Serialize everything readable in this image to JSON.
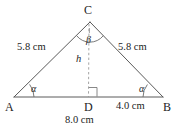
{
  "figure": {
    "shape": "triangle",
    "stroke_color": "#555555",
    "dash_color": "#8a8a8a",
    "text_color": "#1c1c1c",
    "background_color": "#ffffff",
    "vertices": [
      {
        "name": "A",
        "label": "A",
        "x": 14,
        "y": 97
      },
      {
        "name": "B",
        "label": "B",
        "x": 163,
        "y": 97
      },
      {
        "name": "C",
        "label": "C",
        "x": 90,
        "y": 22
      },
      {
        "name": "D",
        "label": "D",
        "x": 88,
        "y": 97
      }
    ],
    "vertex_labels": {
      "a": "A",
      "b": "B",
      "c": "C",
      "d": "D"
    },
    "side_labels": {
      "left_side": "5.8 cm",
      "right_side": "5.8 cm",
      "base_full": "8.0 cm",
      "base_segment_db": "4.0 cm",
      "altitude": "h"
    },
    "angle_labels": {
      "at_a": "α",
      "at_b": "α",
      "at_c": "β"
    },
    "markers": {
      "right_angle_at_d": true,
      "arc_at_a": true,
      "arc_at_b": true,
      "arc_at_c": true,
      "altitude_dashed": true
    }
  }
}
